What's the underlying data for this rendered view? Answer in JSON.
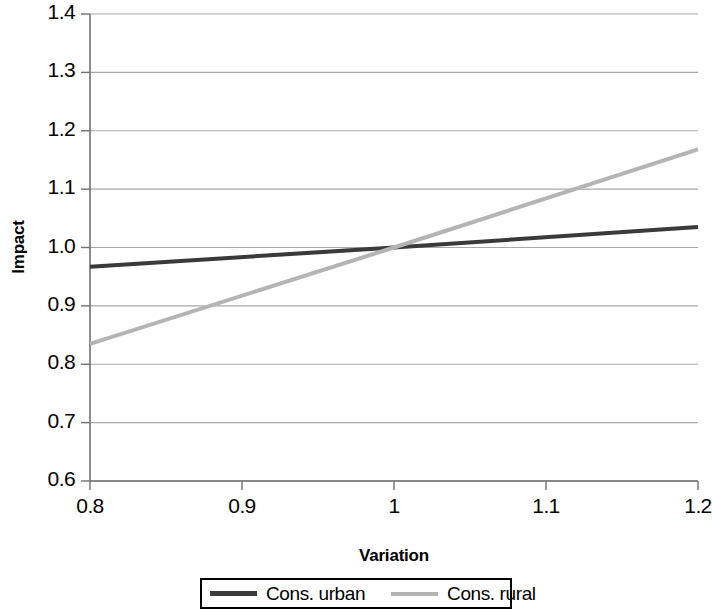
{
  "chart_data": {
    "type": "line",
    "title": "",
    "xlabel": "Variation",
    "ylabel": "Impact",
    "xlim": [
      0.8,
      1.2
    ],
    "ylim": [
      0.6,
      1.4
    ],
    "xticks": [
      "0.8",
      "0.9",
      "1",
      "1.1",
      "1.2"
    ],
    "xtick_values": [
      0.8,
      0.9,
      1.0,
      1.1,
      1.2
    ],
    "yticks": [
      "0.6",
      "0.7",
      "0.8",
      "0.9",
      "1.0",
      "1.1",
      "1.2",
      "1.3",
      "1.4"
    ],
    "ytick_values": [
      0.6,
      0.7,
      0.8,
      0.9,
      1.0,
      1.1,
      1.2,
      1.3,
      1.4
    ],
    "grid": "horizontal",
    "legend_position": "bottom",
    "x": [
      0.8,
      1.0,
      1.2
    ],
    "series": [
      {
        "name": "Cons. urban",
        "color": "#3a3a3a",
        "width": 4,
        "values": [
          0.967,
          1.0,
          1.035
        ]
      },
      {
        "name": "Cons. rural",
        "color": "#b4b4b4",
        "width": 4,
        "values": [
          0.835,
          1.0,
          1.168
        ]
      }
    ]
  },
  "axis": {
    "y_title": "Impact",
    "x_title": "Variation",
    "axis_color": "#808080",
    "grid_color": "#a8a8a8"
  },
  "legend": {
    "items": [
      {
        "label": "Cons. urban"
      },
      {
        "label": "Cons. rural"
      }
    ]
  }
}
